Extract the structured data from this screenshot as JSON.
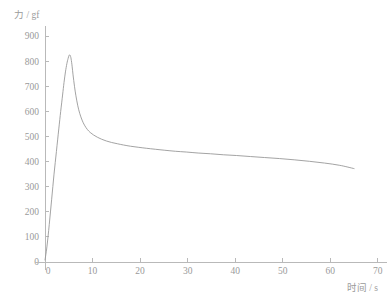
{
  "chart_data": {
    "type": "line",
    "title": "",
    "subtitle": "",
    "xlabel": "时间 / s",
    "ylabel": "力 / gf",
    "xlim": [
      -2,
      72
    ],
    "ylim": [
      -30,
      940
    ],
    "xticks": [
      0,
      10,
      20,
      30,
      40,
      50,
      60,
      70
    ],
    "xtick_labels": [
      "0",
      "10",
      "20",
      "30",
      "40",
      "50",
      "60",
      "70"
    ],
    "yticks": [
      0,
      100,
      200,
      300,
      400,
      500,
      600,
      700,
      800,
      900
    ],
    "ytick_labels": [
      "0",
      "100",
      "200",
      "300",
      "400",
      "500",
      "600",
      "700",
      "800",
      "900"
    ],
    "grid": false,
    "legend": null,
    "annotations": [],
    "series": [
      {
        "name": "力",
        "color": "#999999",
        "x": [
          0.0,
          0.4,
          0.9,
          1.4,
          1.9,
          2.4,
          2.9,
          3.3,
          3.7,
          4.0,
          4.3,
          4.6,
          4.85,
          5.05,
          5.2,
          5.35,
          5.5,
          5.7,
          5.9,
          6.2,
          6.5,
          6.9,
          7.3,
          7.8,
          8.3,
          8.9,
          9.5,
          10.2,
          11.0,
          11.9,
          12.9,
          14.0,
          15.2,
          16.5,
          18.0,
          19.6,
          21.3,
          23.2,
          25.2,
          27.4,
          29.7,
          32.2,
          34.8,
          37.5,
          40.3,
          43.2,
          46.2,
          49.3,
          52.4,
          55.6,
          58.8,
          62.0,
          65.0
        ],
        "y": [
          8,
          60,
          150,
          250,
          350,
          440,
          530,
          600,
          665,
          715,
          757,
          790,
          810,
          822,
          825,
          820,
          808,
          780,
          745,
          700,
          662,
          622,
          592,
          565,
          545,
          528,
          516,
          506,
          497,
          489,
          482,
          476,
          471,
          466,
          461,
          457,
          453,
          449,
          445,
          441,
          438,
          434,
          431,
          427,
          424,
          420,
          416,
          412,
          407,
          401,
          394,
          385,
          372
        ]
      }
    ],
    "peak": {
      "x": 5.2,
      "y": 825
    },
    "end_point": {
      "x": 65.0,
      "y": 372
    }
  }
}
